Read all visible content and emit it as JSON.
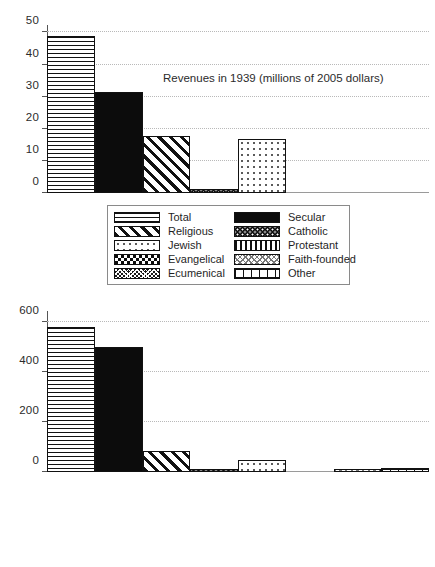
{
  "page": {
    "background": "#ffffff",
    "ink": "#111111"
  },
  "chart_data": [
    {
      "id": "revenues-1939",
      "type": "bar",
      "title": "",
      "annotation": "Revenues in 1939 (millions of 2005 dollars)",
      "xlabel": "",
      "ylabel": "",
      "ylim": [
        0,
        52
      ],
      "yticks": [
        0,
        10,
        20,
        30,
        40,
        50
      ],
      "ytick_labels": [
        "0",
        "10",
        "20",
        "30",
        "40",
        "50"
      ],
      "grid": true,
      "legend_position": "below-left",
      "categories": [
        "Total",
        "Secular",
        "Religious",
        "Catholic",
        "Jewish",
        "Protestant",
        "Faith-founded",
        "Other"
      ],
      "values": [
        48.5,
        31.0,
        17.5,
        0.8,
        16.5,
        0,
        0,
        0
      ],
      "patterns": [
        "p-total",
        "p-secular",
        "p-religious",
        "p-catholic",
        "p-jewish",
        "p-protestant",
        "p-faith",
        "p-other"
      ]
    },
    {
      "id": "revenues-1941",
      "type": "bar",
      "title": "",
      "annotation": "Revenues in 1941 (millions of 2005 dollars)",
      "xlabel": "",
      "ylabel": "",
      "ylim": [
        0,
        640
      ],
      "yticks": [
        0,
        200,
        400,
        600
      ],
      "ytick_labels": [
        "0",
        "200",
        "400",
        "600"
      ],
      "grid": true,
      "legend_position": "below-left",
      "categories": [
        "Total",
        "Secular",
        "Religious",
        "Catholic",
        "Jewish",
        "Protestant",
        "Faith-founded",
        "Other"
      ],
      "values": [
        575,
        495,
        80,
        7,
        45,
        0,
        7,
        13
      ],
      "patterns": [
        "p-total",
        "p-secular",
        "p-religious",
        "p-catholic",
        "p-jewish",
        "p-protestant",
        "p-faith",
        "p-other"
      ]
    }
  ],
  "legend": {
    "entries": [
      {
        "label": "Total",
        "pattern": "p-total"
      },
      {
        "label": "Secular",
        "pattern": "p-secular"
      },
      {
        "label": "Religious",
        "pattern": "p-religious"
      },
      {
        "label": "Catholic",
        "pattern": "p-catholic"
      },
      {
        "label": "Jewish",
        "pattern": "p-jewish"
      },
      {
        "label": "Protestant",
        "pattern": "p-protestant"
      },
      {
        "label": "Evangelical",
        "pattern": "p-evangelical"
      },
      {
        "label": "Faith-founded",
        "pattern": "p-faith"
      },
      {
        "label": "Ecumenical",
        "pattern": "p-ecumenical"
      },
      {
        "label": "Other",
        "pattern": "p-other"
      }
    ]
  }
}
